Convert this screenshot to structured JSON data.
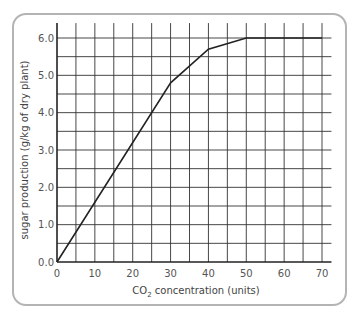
{
  "chart_data": {
    "type": "line",
    "title": "",
    "xlabel": "CO2 concentration (units)",
    "xlabel_main": "CO",
    "xlabel_sub": "2",
    "xlabel_rest": " concentration (units)",
    "ylabel": "sugar production (g/kg of dry plant)",
    "x": [
      0,
      10,
      20,
      30,
      40,
      50,
      60,
      70
    ],
    "series": [
      {
        "name": "sugar production",
        "x": [
          0,
          30,
          40,
          50,
          70
        ],
        "y": [
          0.0,
          4.8,
          5.7,
          6.0,
          6.0
        ]
      }
    ],
    "xlim": [
      0,
      72.5
    ],
    "ylim": [
      0,
      6.4
    ],
    "xticks": [
      "0",
      "10",
      "20",
      "30",
      "40",
      "50",
      "60",
      "70"
    ],
    "yticks": [
      "0.0",
      "1.0",
      "2.0",
      "3.0",
      "4.0",
      "5.0",
      "6.0"
    ],
    "grid": true,
    "grid_x_step": 5,
    "grid_y_step": 0.5,
    "legend": "none",
    "colors": {
      "line": "#222222",
      "grid": "#333333",
      "frame": "#b4b4b4",
      "text": "#555555"
    }
  }
}
